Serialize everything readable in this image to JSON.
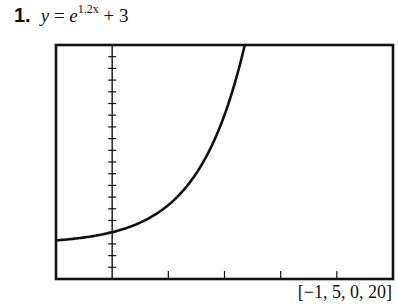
{
  "problem": {
    "number": "1.",
    "equation_y": "y",
    "equation_eq": " = ",
    "equation_base": "e",
    "equation_exponent": "1.2x",
    "equation_rest": " + 3"
  },
  "window_label": "[−1, 5, 0, 20]",
  "chart_data": {
    "type": "line",
    "xlabel": "",
    "ylabel": "",
    "xlim": [
      -1,
      5
    ],
    "ylim": [
      0,
      20
    ],
    "x_tick_step": 1,
    "y_tick_step": 1,
    "grid": false,
    "legend": null,
    "series": [
      {
        "name": "y = e^(1.2x) + 3",
        "function": "exp(1.2*x)+3",
        "x": [
          -1,
          -0.5,
          0,
          0.5,
          1,
          1.5,
          2,
          2.36
        ],
        "y": [
          3.3,
          3.55,
          4.0,
          4.82,
          6.32,
          9.05,
          14.02,
          20.0
        ]
      }
    ],
    "annotations": [
      "[−1, 5, 0, 20]"
    ]
  },
  "colors": {
    "frame": "#111111",
    "curve": "#111111",
    "background": "#ffffff"
  }
}
